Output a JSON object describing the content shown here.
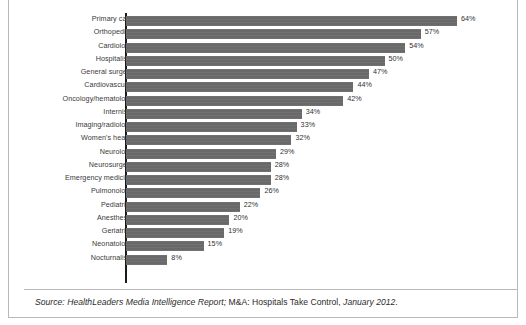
{
  "figure": {
    "source_note_parts": {
      "lead_italic": "Source: HealthLeaders Media Intelligence Report;",
      "mid_roman": " M&A: Hospitals Take Control,",
      "tail_italic": " January 2012."
    },
    "colors": {
      "bar": "#696969",
      "axis": "#1a1a1a",
      "frame": "#b9b9b9",
      "label_text": "#3a3a3a",
      "background": "#ffffff"
    }
  },
  "chart_data": {
    "type": "bar",
    "orientation": "horizontal",
    "title": "",
    "subtitle": "",
    "xlabel": "",
    "ylabel": "",
    "xlim": [
      0,
      70
    ],
    "grid": false,
    "legend": "none",
    "value_suffix": "%",
    "categories": [
      "Primary care",
      "Orthopedics",
      "Cardiology",
      "Hospitalists",
      "General surgery",
      "Cardiovascular",
      "Oncology/hematology",
      "Internists",
      "Imaging/radiology",
      "Women's health",
      "Neurology",
      "Neurosurgery",
      "Emergency medicine",
      "Pulmonology",
      "Pediatrics",
      "Anesthesia",
      "Geriatrics",
      "Neonatology",
      "Nocturnalists"
    ],
    "values": [
      64,
      57,
      54,
      50,
      47,
      44,
      42,
      34,
      33,
      32,
      29,
      28,
      28,
      26,
      22,
      20,
      19,
      15,
      8
    ],
    "data_labels": [
      "64%",
      "57%",
      "54%",
      "50%",
      "47%",
      "44%",
      "42%",
      "34%",
      "33%",
      "32%",
      "29%",
      "28%",
      "28%",
      "26%",
      "22%",
      "20%",
      "19%",
      "15%",
      "8%"
    ]
  }
}
